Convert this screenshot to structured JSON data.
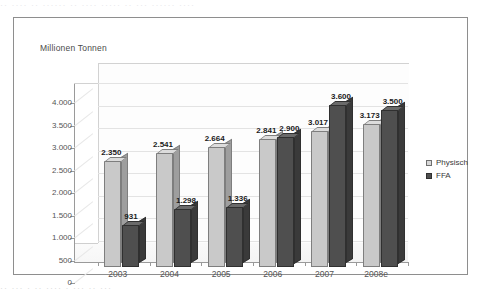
{
  "scan": {
    "top_fragment": "·· ···· ·· ······ ·· ···· ·····  ·· ··· ······ ····",
    "bottom_fragment": "··  ··· ·  ··  ···· ·   ···  ·· ···"
  },
  "legend": {
    "items": [
      {
        "label": "Physisch",
        "color": "#d8d8d8",
        "key": "physisch"
      },
      {
        "label": "FFA",
        "color": "#4f4f4f",
        "key": "ffa"
      }
    ]
  },
  "chart_data": {
    "type": "bar",
    "title": "",
    "subtitle": "",
    "xlabel": "",
    "ylabel": "Millionen Tonnen",
    "ylim": [
      0,
      4000
    ],
    "ytick_labels": [
      "0",
      "500",
      "1.000",
      "1.500",
      "2.000",
      "2.500",
      "3.000",
      "3.500",
      "4.000"
    ],
    "ytick_values": [
      0,
      500,
      1000,
      1500,
      2000,
      2500,
      3000,
      3500,
      4000
    ],
    "grid": true,
    "legend_position": "right",
    "style": "3d-clustered-column",
    "categories": [
      "2003",
      "2004",
      "2005",
      "2006",
      "2007",
      "2008e"
    ],
    "series": [
      {
        "name": "Physisch",
        "color": "#c9c9c9",
        "values": [
          2350,
          2541,
          2664,
          2841,
          3017,
          3173
        ],
        "labels": [
          "2.350",
          "2.541",
          "2.664",
          "2.841",
          "3.017",
          "3.173"
        ]
      },
      {
        "name": "FFA",
        "color": "#4f4f4f",
        "values": [
          931,
          1298,
          1336,
          2900,
          3600,
          3500
        ],
        "labels": [
          "931",
          "1.298",
          "1.336",
          "2.900",
          "3.600",
          "3.500"
        ]
      }
    ]
  }
}
